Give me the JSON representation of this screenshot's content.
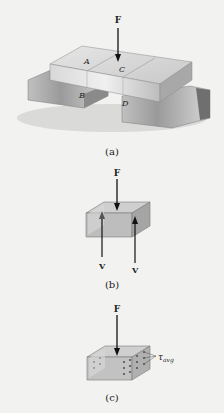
{
  "figure_a": {
    "caption": "(a)",
    "force_label": "F",
    "labels": {
      "A": "A",
      "B": "B",
      "C": "C",
      "D": "D"
    }
  },
  "figure_b": {
    "caption": "(b)",
    "force_label": "F",
    "shear_left": "V",
    "shear_right": "V"
  },
  "figure_c": {
    "caption": "(c)",
    "force_label": "F",
    "stress_label_base": "τ",
    "stress_label_sub": "avg"
  },
  "colors": {
    "background": "#f2f2f0",
    "block_light": "#dcdcdc",
    "block_mid": "#bdbdbd",
    "block_dark": "#8e8e8e",
    "arrow": "#111111"
  }
}
